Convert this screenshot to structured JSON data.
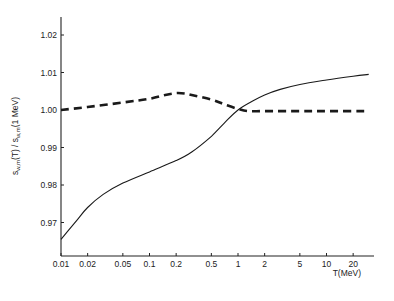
{
  "chart_data": {
    "type": "line",
    "title": "",
    "xlabel": "T(MeV)",
    "ylabel": "s_{w,m}(T) / s_{w,m}(1 MeV)",
    "ylabel_parts": {
      "s1": "s",
      "sub1": "w,m",
      "mid": "(T) / s",
      "sub2": "w,m",
      "end": "(1 MeV)"
    },
    "xscale": "log",
    "xlim": [
      0.01,
      32
    ],
    "ylim": [
      0.961,
      1.025
    ],
    "grid": false,
    "legend": null,
    "x_ticks": [
      {
        "value": 0.01,
        "label": "0.01"
      },
      {
        "value": 0.02,
        "label": "0.02"
      },
      {
        "value": 0.05,
        "label": "0.05"
      },
      {
        "value": 0.1,
        "label": "0.1"
      },
      {
        "value": 0.2,
        "label": "0.2"
      },
      {
        "value": 0.5,
        "label": "0.5"
      },
      {
        "value": 1,
        "label": "1"
      },
      {
        "value": 2,
        "label": "2"
      },
      {
        "value": 5,
        "label": "5"
      },
      {
        "value": 10,
        "label": "10"
      },
      {
        "value": 20,
        "label": "20"
      }
    ],
    "y_ticks": [
      {
        "value": 0.97,
        "label": "0.97"
      },
      {
        "value": 0.98,
        "label": "0.98"
      },
      {
        "value": 0.99,
        "label": "0.99"
      },
      {
        "value": 1.0,
        "label": "1.00"
      },
      {
        "value": 1.01,
        "label": "1.01"
      },
      {
        "value": 1.02,
        "label": "1.02"
      }
    ],
    "series": [
      {
        "name": "solid",
        "style": "solid",
        "x": [
          0.01,
          0.015,
          0.02,
          0.03,
          0.05,
          0.1,
          0.2,
          0.3,
          0.5,
          0.7,
          1,
          1.5,
          2,
          3,
          5,
          10,
          20,
          30
        ],
        "values": [
          0.9655,
          0.9705,
          0.974,
          0.9775,
          0.9805,
          0.9835,
          0.9865,
          0.9888,
          0.993,
          0.9965,
          1.0,
          1.0025,
          1.004,
          1.0055,
          1.0068,
          1.008,
          1.009,
          1.0095
        ]
      },
      {
        "name": "dashed",
        "style": "dashed",
        "x": [
          0.01,
          0.02,
          0.05,
          0.1,
          0.15,
          0.2,
          0.25,
          0.3,
          0.5,
          0.7,
          1,
          1.3,
          2,
          5,
          10,
          30
        ],
        "values": [
          1.0,
          1.0008,
          1.002,
          1.003,
          1.004,
          1.0045,
          1.0044,
          1.004,
          1.0028,
          1.0015,
          1.0003,
          0.9997,
          0.9997,
          0.9997,
          0.9997,
          0.9997
        ]
      }
    ]
  }
}
